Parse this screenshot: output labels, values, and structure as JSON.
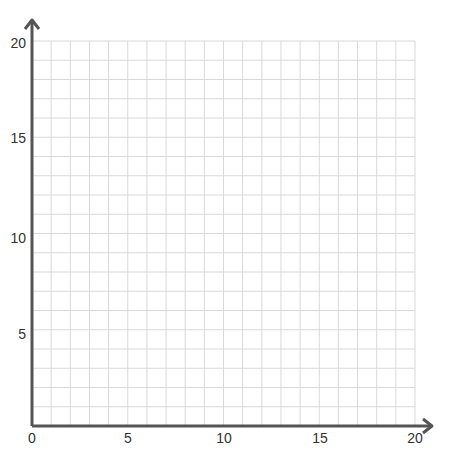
{
  "chart_data": {
    "type": "scatter",
    "title": "",
    "xlabel": "",
    "ylabel": "",
    "xlim": [
      0,
      20
    ],
    "ylim": [
      0,
      20
    ],
    "grid": true,
    "grid_step": 1,
    "x_ticks": [
      "0",
      "5",
      "10",
      "15",
      "20"
    ],
    "y_ticks": [
      "5",
      "10",
      "15",
      "20"
    ],
    "series": [],
    "legend": null
  },
  "colors": {
    "axis": "#555555",
    "grid": "#d9d9d9",
    "tick_text": "#333333"
  }
}
